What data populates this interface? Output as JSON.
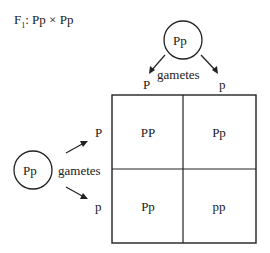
{
  "title": {
    "prefix": "F",
    "sub": "1",
    "cross": ": Pp × Pp"
  },
  "top_parent": {
    "genotype": "Pp",
    "gametes_label": "gametes",
    "gametes": [
      "P",
      "p"
    ]
  },
  "left_parent": {
    "genotype": "Pp",
    "gametes_label": "gametes",
    "gametes": [
      "P",
      "p"
    ]
  },
  "grid": {
    "rows": [
      [
        "PP",
        "Pp"
      ],
      [
        "Pp",
        "pp"
      ]
    ]
  }
}
